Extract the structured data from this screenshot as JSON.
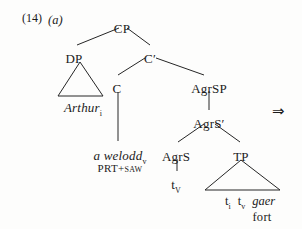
{
  "figure": {
    "example_number": "(14)",
    "example_letter": "(a)",
    "derivation_arrow": "⇒"
  },
  "tree": {
    "nodes": [
      {
        "id": "cp",
        "label": "CP",
        "x": 122,
        "y": 22
      },
      {
        "id": "dp",
        "label": "DP",
        "x": 74,
        "y": 52
      },
      {
        "id": "cbar",
        "label": "C",
        "prime": "′",
        "x": 150,
        "y": 52
      },
      {
        "id": "c",
        "label": "C",
        "x": 117,
        "y": 82
      },
      {
        "id": "agrsp",
        "label": "AgrSP",
        "x": 209,
        "y": 82
      },
      {
        "id": "agrsbar",
        "label": "AgrS",
        "prime": "′",
        "x": 209,
        "y": 117
      },
      {
        "id": "agrs",
        "label": "AgrS",
        "x": 176,
        "y": 150
      },
      {
        "id": "tp",
        "label": "TP",
        "x": 241,
        "y": 150
      }
    ],
    "lexical_items": [
      {
        "id": "arthur",
        "text": "Arthur",
        "subscript": "i",
        "italic": true,
        "x": 83,
        "y": 101
      },
      {
        "id": "a-welodd",
        "text": "a welodd",
        "subscript": "v",
        "italic": true,
        "x": 120,
        "y": 149
      },
      {
        "id": "tv-agrs",
        "text": "t",
        "subscript": "V",
        "italic": false,
        "x": 176,
        "y": 178
      }
    ],
    "glosses": [
      {
        "id": "prt-saw",
        "text": "PRT+saw",
        "x": 120,
        "y": 163
      },
      {
        "id": "fort",
        "text": "fort",
        "x": 262,
        "y": 211
      }
    ],
    "tp_terminals": {
      "x": 250,
      "y": 195,
      "items": [
        {
          "text": "t",
          "subscript": "i",
          "italic": false
        },
        {
          "text": "t",
          "subscript": "v",
          "italic": false
        },
        {
          "text": "gaer",
          "subscript": "",
          "italic": true
        }
      ]
    },
    "triangles": [
      {
        "id": "dp-triangle",
        "apex_x": 80,
        "apex_y": 62,
        "left_x": 58,
        "right_x": 103,
        "base_y": 96
      },
      {
        "id": "tp-triangle",
        "apex_x": 241,
        "apex_y": 160,
        "left_x": 205,
        "right_x": 280,
        "base_y": 190
      }
    ],
    "edges": [
      {
        "from": "cp",
        "to": "dp",
        "x1": 119,
        "y1": 28,
        "x2": 77,
        "y2": 45
      },
      {
        "from": "cp",
        "to": "cbar",
        "x1": 127,
        "y1": 28,
        "x2": 150,
        "y2": 45
      },
      {
        "from": "cbar",
        "to": "c",
        "x1": 145,
        "y1": 58,
        "x2": 118,
        "y2": 75
      },
      {
        "from": "cbar",
        "to": "agrsp",
        "x1": 156,
        "y1": 58,
        "x2": 204,
        "y2": 75
      },
      {
        "from": "c",
        "to": "a-welodd",
        "x1": 118,
        "y1": 92,
        "x2": 118,
        "y2": 141
      },
      {
        "from": "agrsp",
        "to": "agrsbar",
        "x1": 209,
        "y1": 91,
        "x2": 209,
        "y2": 110
      },
      {
        "from": "agrsbar",
        "to": "agrs",
        "x1": 204,
        "y1": 124,
        "x2": 178,
        "y2": 142
      },
      {
        "from": "agrsbar",
        "to": "tp",
        "x1": 215,
        "y1": 124,
        "x2": 240,
        "y2": 142
      },
      {
        "from": "agrs",
        "to": "tv-agrs",
        "x1": 177,
        "y1": 159,
        "x2": 177,
        "y2": 171
      }
    ]
  }
}
